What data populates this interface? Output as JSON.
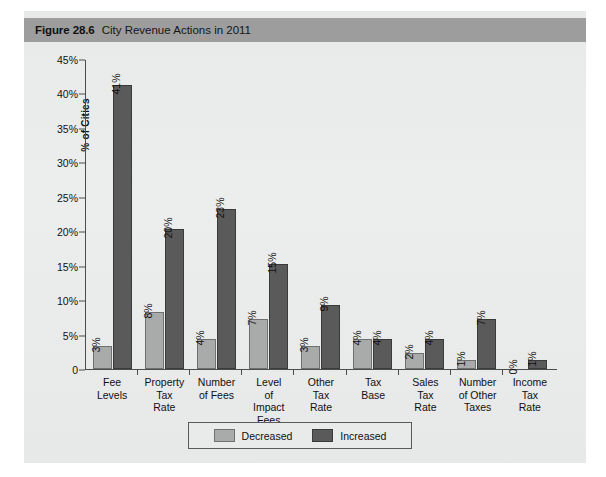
{
  "figure": {
    "number": "Figure 28.6",
    "title": "City Revenue Actions in 2011"
  },
  "legend": {
    "items": [
      {
        "label": "Decreased",
        "color": "#a9aaaa"
      },
      {
        "label": "Increased",
        "color": "#5a5a5a"
      }
    ]
  },
  "axis": {
    "ylabel": "% of Cities",
    "yticks": [
      "0",
      "5%",
      "10%",
      "15%",
      "20%",
      "25%",
      "30%",
      "35%",
      "40%",
      "45%"
    ]
  },
  "chart_data": {
    "type": "bar",
    "title": "City Revenue Actions in 2011",
    "xlabel": "",
    "ylabel": "% of Cities",
    "ylim": [
      0,
      45
    ],
    "ytick_values": [
      0,
      5,
      10,
      15,
      20,
      25,
      30,
      35,
      40,
      45
    ],
    "grid": false,
    "legend_position": "bottom-center",
    "categories": [
      "Fee Levels",
      "Property Tax Rate",
      "Number of Fees",
      "Level of Impact Fees",
      "Other Tax Rate",
      "Tax Base",
      "Sales Tax Rate",
      "Number of Other Taxes",
      "Income Tax Rate"
    ],
    "category_lines": [
      [
        "Fee",
        "Levels"
      ],
      [
        "Property",
        "Tax",
        "Rate"
      ],
      [
        "Number",
        "of Fees"
      ],
      [
        "Level",
        "of",
        "Impact",
        "Fees"
      ],
      [
        "Other",
        "Tax",
        "Rate"
      ],
      [
        "Tax",
        "Base"
      ],
      [
        "Sales",
        "Tax",
        "Rate"
      ],
      [
        "Number",
        "of Other",
        "Taxes"
      ],
      [
        "Income",
        "Tax",
        "Rate"
      ]
    ],
    "series": [
      {
        "name": "Decreased",
        "color": "#a9aaaa",
        "values": [
          3,
          8,
          4,
          7,
          3,
          4,
          2,
          1,
          0
        ],
        "labels": [
          "3%",
          "8%",
          "4%",
          "7%",
          "3%",
          "4%",
          "2%",
          "1%",
          "0%"
        ]
      },
      {
        "name": "Increased",
        "color": "#5a5a5a",
        "values": [
          41,
          20,
          23,
          15,
          9,
          4,
          4,
          7,
          1
        ],
        "labels": [
          "41%",
          "20%",
          "23%",
          "15%",
          "9%",
          "4%",
          "4%",
          "7%",
          "1%"
        ]
      }
    ]
  }
}
